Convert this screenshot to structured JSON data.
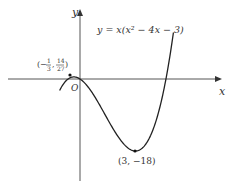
{
  "chart_data": {
    "type": "line",
    "title": "",
    "equation_label": "y = x(x² − 4x − 3)",
    "xlabel": "x",
    "ylabel": "y",
    "origin_label": "O",
    "grid": false,
    "legend": "none",
    "series": [
      {
        "name": "y = x(x^2 - 4x - 3)",
        "function": "x^3 - 4x^2 - 3x",
        "x_range": [
          -1.1,
          5.05
        ]
      }
    ],
    "annotations": [
      {
        "label": "(−⅓, 14/27)",
        "x": -0.3333,
        "y": 0.5185,
        "kind": "local maximum"
      },
      {
        "label": "(3, −18)",
        "x": 3,
        "y": -18,
        "kind": "local minimum"
      }
    ],
    "colors": {
      "curve": "#222222",
      "axes": "#555555",
      "text": "#333333"
    }
  },
  "labels": {
    "equation": "y = x(x² − 4x − 3)",
    "x_axis": "x",
    "y_axis": "y",
    "origin": "O",
    "max_point": "(−⅓, 14/27)",
    "min_point": "(3, −18)"
  }
}
